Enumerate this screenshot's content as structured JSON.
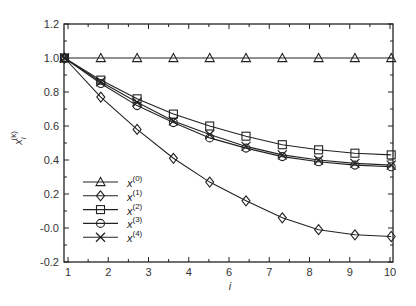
{
  "chart_data": {
    "type": "line",
    "title": "",
    "xlabel": "i",
    "ylabel": "x_i^(k)",
    "ylim": [
      -0.2,
      1.2
    ],
    "xlim": [
      1,
      10
    ],
    "grid": false,
    "legend_position": "lower left",
    "x": [
      1,
      2,
      3,
      4,
      5,
      6,
      7,
      8,
      9,
      10
    ],
    "x_tick_labels": [
      "1",
      "2",
      "3",
      "4",
      "6",
      "7",
      "8",
      "9",
      "10"
    ],
    "y_tick_labels": [
      "1.2",
      "1.0",
      "0.8",
      "0.6",
      "0.4",
      "0.2",
      "-0.0",
      "-0.2"
    ],
    "y_ticks": [
      1.2,
      1.0,
      0.8,
      0.6,
      0.4,
      0.2,
      0.0,
      -0.2
    ],
    "series": [
      {
        "name": "x(0)",
        "sup": "(0)",
        "marker": "triangle",
        "values": [
          1.0,
          1.0,
          1.0,
          1.0,
          1.0,
          1.0,
          1.0,
          1.0,
          1.0,
          1.0
        ]
      },
      {
        "name": "x(1)",
        "sup": "(1)",
        "marker": "diamond",
        "values": [
          1.0,
          0.77,
          0.58,
          0.41,
          0.27,
          0.16,
          0.06,
          -0.01,
          -0.04,
          -0.05
        ]
      },
      {
        "name": "x(2)",
        "sup": "(2)",
        "marker": "square",
        "values": [
          1.0,
          0.87,
          0.76,
          0.67,
          0.6,
          0.54,
          0.49,
          0.46,
          0.44,
          0.43
        ]
      },
      {
        "name": "x(3)",
        "sup": "(3)",
        "marker": "circle",
        "values": [
          1.0,
          0.85,
          0.72,
          0.62,
          0.53,
          0.47,
          0.42,
          0.39,
          0.37,
          0.36
        ]
      },
      {
        "name": "x(4)",
        "sup": "(4)",
        "marker": "x",
        "values": [
          1.0,
          0.86,
          0.74,
          0.63,
          0.55,
          0.48,
          0.43,
          0.4,
          0.38,
          0.37
        ]
      }
    ]
  },
  "legend": {
    "items": [
      {
        "base": "x",
        "sup": "(0)"
      },
      {
        "base": "x",
        "sup": "(1)"
      },
      {
        "base": "x",
        "sup": "(2)"
      },
      {
        "base": "x",
        "sup": "(3)"
      },
      {
        "base": "x",
        "sup": "(4)"
      }
    ]
  },
  "axes": {
    "xlabel": "i",
    "ylabel_base": "x",
    "ylabel_sub": "i",
    "ylabel_sup": "(k)"
  }
}
